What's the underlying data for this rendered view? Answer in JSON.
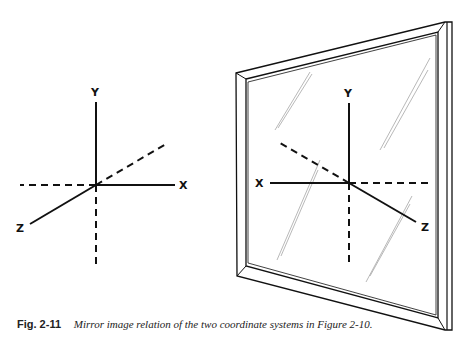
{
  "figure": {
    "left_system": {
      "x_label": "X",
      "y_label": "Y",
      "z_label": "Z"
    },
    "mirror_system": {
      "x_label": "X",
      "y_label": "Y",
      "z_label": "Z"
    }
  },
  "caption": {
    "number": "Fig. 2-11",
    "text": "Mirror image relation of the two coordinate systems in Figure 2-10."
  }
}
